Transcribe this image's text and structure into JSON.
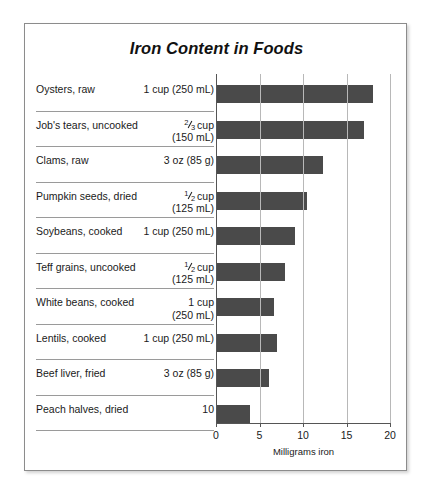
{
  "chart_data": {
    "type": "bar",
    "title": "Iron Content in Foods",
    "orientation": "horizontal",
    "xlabel": "Milligrams iron",
    "ylabel": "",
    "xlim": [
      0,
      20
    ],
    "xticks": [
      0,
      5,
      10,
      15,
      20
    ],
    "xtick_labels": [
      "0",
      "5",
      "10",
      "15",
      "20"
    ],
    "grid": true,
    "legend": "none",
    "bar_color": "#4a4a4a",
    "categories": [
      "Oysters, raw",
      "Job's tears, uncooked",
      "Clams, raw",
      "Pumpkin seeds, dried",
      "Soybeans, cooked",
      "Teff grains, uncooked",
      "White beans, cooked",
      "Lentils, cooked",
      "Beef liver, fried",
      "Peach halves, dried"
    ],
    "values": [
      18.0,
      17.0,
      12.3,
      10.5,
      9.1,
      7.9,
      6.7,
      7.0,
      6.1,
      3.9
    ]
  },
  "rows": [
    {
      "food": "Oysters, raw",
      "qty_line1": "1 cup (250 mL)",
      "qty_line2": "",
      "frac_num": "",
      "frac_den": "",
      "frac_suffix": "",
      "value": 18.0
    },
    {
      "food": "Job's tears, uncooked",
      "qty_line1": "",
      "qty_line2": "(150 mL)",
      "frac_num": "2",
      "frac_den": "3",
      "frac_suffix": " cup",
      "value": 17.0
    },
    {
      "food": "Clams, raw",
      "qty_line1": "3 oz (85 g)",
      "qty_line2": "",
      "frac_num": "",
      "frac_den": "",
      "frac_suffix": "",
      "value": 12.3
    },
    {
      "food": "Pumpkin seeds, dried",
      "qty_line1": "",
      "qty_line2": "(125 mL)",
      "frac_num": "1",
      "frac_den": "2",
      "frac_suffix": " cup",
      "value": 10.5
    },
    {
      "food": "Soybeans, cooked",
      "qty_line1": "1 cup (250 mL)",
      "qty_line2": "",
      "frac_num": "",
      "frac_den": "",
      "frac_suffix": "",
      "value": 9.1
    },
    {
      "food": "Teff grains, uncooked",
      "qty_line1": "",
      "qty_line2": "(125 mL)",
      "frac_num": "1",
      "frac_den": "2",
      "frac_suffix": " cup",
      "value": 7.9
    },
    {
      "food": "White beans, cooked",
      "qty_line1": "1 cup",
      "qty_line2": "(250 mL)",
      "frac_num": "",
      "frac_den": "",
      "frac_suffix": "",
      "value": 6.7
    },
    {
      "food": "Lentils, cooked",
      "qty_line1": "1 cup (250 mL)",
      "qty_line2": "",
      "frac_num": "",
      "frac_den": "",
      "frac_suffix": "",
      "value": 7.0
    },
    {
      "food": "Beef liver, fried",
      "qty_line1": "3 oz (85 g)",
      "qty_line2": "",
      "frac_num": "",
      "frac_den": "",
      "frac_suffix": "",
      "value": 6.1
    },
    {
      "food": "Peach halves, dried",
      "qty_line1": "10",
      "qty_line2": "",
      "frac_num": "",
      "frac_den": "",
      "frac_suffix": "",
      "value": 3.9
    }
  ]
}
